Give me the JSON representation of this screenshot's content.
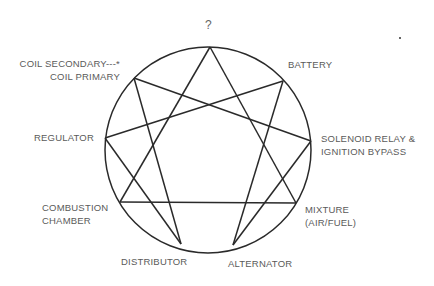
{
  "diagram": {
    "type": "enneagram",
    "circle": {
      "cx": 208,
      "cy": 150,
      "r": 103,
      "stroke": "#2a2a2a"
    },
    "nodes": [
      {
        "id": "top",
        "x": 210,
        "y": 47
      },
      {
        "id": "battery",
        "x": 283,
        "y": 81
      },
      {
        "id": "solenoid",
        "x": 311,
        "y": 141
      },
      {
        "id": "mixture",
        "x": 296,
        "y": 203
      },
      {
        "id": "alternator",
        "x": 233,
        "y": 245
      },
      {
        "id": "distributor",
        "x": 181,
        "y": 244
      },
      {
        "id": "combustion",
        "x": 120,
        "y": 202
      },
      {
        "id": "regulator",
        "x": 105,
        "y": 138
      },
      {
        "id": "coil",
        "x": 134,
        "y": 78
      }
    ],
    "edges": [
      [
        "top",
        "mixture"
      ],
      [
        "mixture",
        "combustion"
      ],
      [
        "combustion",
        "top"
      ],
      [
        "battery",
        "alternator"
      ],
      [
        "alternator",
        "solenoid"
      ],
      [
        "solenoid",
        "coil"
      ],
      [
        "coil",
        "distributor"
      ],
      [
        "distributor",
        "regulator"
      ],
      [
        "regulator",
        "battery"
      ]
    ]
  },
  "labels": {
    "top": "?",
    "battery": "BATTERY",
    "solenoid_line1": "SOLENOID RELAY &",
    "solenoid_line2": "IGNITION BYPASS",
    "mixture_line1": "MIXTURE",
    "mixture_line2": "(AIR/FUEL)",
    "alternator": "ALTERNATOR",
    "distributor": "DISTRIBUTOR",
    "combustion_line1": "COMBUSTION",
    "combustion_line2": "CHAMBER",
    "regulator": "REGULATOR",
    "coil_line1": "COIL SECONDARY---*",
    "coil_line2": "COIL PRIMARY"
  }
}
